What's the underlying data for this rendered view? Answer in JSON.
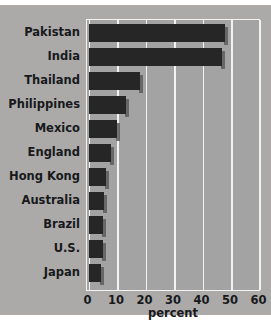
{
  "chart_data": {
    "type": "bar",
    "orientation": "horizontal",
    "title": "",
    "xlabel": "percent",
    "ylabel": "",
    "xlim": [
      0,
      60
    ],
    "xticks": [
      0,
      10,
      20,
      30,
      40,
      50,
      60
    ],
    "grid": true,
    "legend": null,
    "categories": [
      "Pakistan",
      "India",
      "Thailand",
      "Philippines",
      "Mexico",
      "England",
      "Hong Kong",
      "Australia",
      "Brazil",
      "U.S.",
      "Japan"
    ],
    "values": [
      48,
      47,
      18,
      13,
      10,
      8,
      6,
      5.5,
      5,
      5,
      4.5
    ]
  },
  "style": {
    "figure_background": "#acaaa8",
    "plot_background": "#a3a3a3",
    "bar_color": "#262626",
    "gridline_color": "#f2f2f2",
    "text_color": "#17191c",
    "shadow_color": "#5d5d5d"
  }
}
